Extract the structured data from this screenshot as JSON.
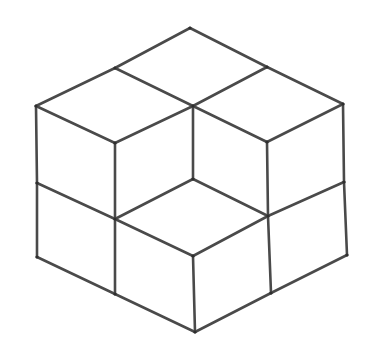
{
  "figure": {
    "type": "isometric-cube-stack",
    "stroke_color": "#4a4a4a",
    "background": "#ffffff",
    "vertices": {
      "top": [
        190,
        28
      ],
      "top_left_mid": [
        115,
        68
      ],
      "top_right_mid": [
        267,
        67
      ],
      "left_top": [
        36,
        106
      ],
      "center_top": [
        193,
        106
      ],
      "right_top": [
        343,
        104
      ],
      "left_cube_front_top": [
        115,
        143
      ],
      "right_cube_front_top": [
        267,
        142
      ],
      "left_mid": [
        37,
        183
      ],
      "center_inner": [
        193,
        179
      ],
      "right_mid": [
        344,
        182
      ],
      "left_front_mid": [
        115,
        219
      ],
      "right_front_mid": [
        268,
        216
      ],
      "front_center_top": [
        193,
        256
      ],
      "left_bottom": [
        37,
        257
      ],
      "right_bottom": [
        347,
        255
      ],
      "left_bottom_mid": [
        115,
        294
      ],
      "right_bottom_mid": [
        271,
        293
      ],
      "bottom": [
        195,
        332
      ]
    },
    "edges": [
      [
        "top",
        "top_left_mid"
      ],
      [
        "top",
        "top_right_mid"
      ],
      [
        "top_left_mid",
        "left_top"
      ],
      [
        "top_left_mid",
        "center_top"
      ],
      [
        "top_right_mid",
        "right_top"
      ],
      [
        "top_right_mid",
        "center_top"
      ],
      [
        "left_top",
        "left_cube_front_top"
      ],
      [
        "center_top",
        "left_cube_front_top"
      ],
      [
        "center_top",
        "right_cube_front_top"
      ],
      [
        "right_top",
        "right_cube_front_top"
      ],
      [
        "left_top",
        "left_mid"
      ],
      [
        "left_mid",
        "left_bottom"
      ],
      [
        "left_cube_front_top",
        "left_front_mid"
      ],
      [
        "left_front_mid",
        "left_bottom_mid"
      ],
      [
        "center_top",
        "center_inner"
      ],
      [
        "right_cube_front_top",
        "right_front_mid"
      ],
      [
        "right_front_mid",
        "right_bottom_mid"
      ],
      [
        "right_top",
        "right_mid"
      ],
      [
        "right_mid",
        "right_bottom"
      ],
      [
        "left_mid",
        "left_front_mid"
      ],
      [
        "left_front_mid",
        "front_center_top"
      ],
      [
        "center_inner",
        "left_front_mid"
      ],
      [
        "center_inner",
        "right_front_mid"
      ],
      [
        "right_front_mid",
        "right_mid"
      ],
      [
        "front_center_top",
        "right_front_mid"
      ],
      [
        "front_center_top",
        "bottom"
      ],
      [
        "left_bottom",
        "left_bottom_mid"
      ],
      [
        "left_bottom_mid",
        "bottom"
      ],
      [
        "bottom",
        "right_bottom_mid"
      ],
      [
        "right_bottom_mid",
        "right_bottom"
      ]
    ],
    "cube_count": 7
  }
}
